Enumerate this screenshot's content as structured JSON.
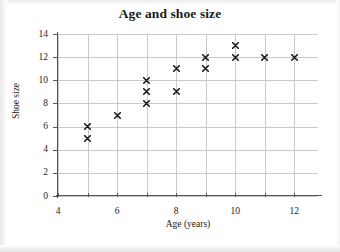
{
  "chart_data": {
    "type": "scatter",
    "title": "Age and shoe size",
    "xlabel": "Age (years)",
    "ylabel": "Shoe size",
    "xlim": [
      4,
      12.8
    ],
    "ylim": [
      0,
      14
    ],
    "xticks": [
      4,
      5,
      6,
      7,
      8,
      9,
      10,
      11,
      12
    ],
    "xtick_labels": [
      "4",
      "",
      "6",
      "",
      "8",
      "",
      "10",
      "",
      "12"
    ],
    "yticks": [
      0,
      2,
      4,
      6,
      8,
      10,
      12,
      14
    ],
    "ytick_labels": [
      "0",
      "2",
      "4",
      "6",
      "8",
      "10",
      "12",
      "14"
    ],
    "grid": true,
    "legend": false,
    "marker": "x-cross",
    "marker_color": "#1a1a1a",
    "points": [
      {
        "x": 5,
        "y": 6
      },
      {
        "x": 5,
        "y": 5
      },
      {
        "x": 6,
        "y": 7
      },
      {
        "x": 7,
        "y": 10
      },
      {
        "x": 7,
        "y": 9
      },
      {
        "x": 7,
        "y": 8
      },
      {
        "x": 8,
        "y": 11
      },
      {
        "x": 8,
        "y": 9
      },
      {
        "x": 9,
        "y": 12
      },
      {
        "x": 9,
        "y": 11
      },
      {
        "x": 10,
        "y": 13
      },
      {
        "x": 10,
        "y": 12
      },
      {
        "x": 11,
        "y": 12
      },
      {
        "x": 12,
        "y": 12
      }
    ]
  }
}
